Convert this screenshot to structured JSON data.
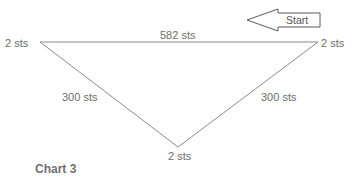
{
  "diagram": {
    "title": "Chart 3",
    "start_label": "Start",
    "vertices": {
      "left": {
        "label": "2 sts",
        "x": 40,
        "y": 42
      },
      "right": {
        "label": "2 sts",
        "x": 318,
        "y": 42
      },
      "bottom": {
        "label": "2 sts",
        "x": 178,
        "y": 147
      }
    },
    "edges": {
      "top": {
        "label": "582 sts",
        "from": "left",
        "to": "right"
      },
      "left": {
        "label": "300 sts",
        "from": "left",
        "to": "bottom"
      },
      "right": {
        "label": "300 sts",
        "from": "right",
        "to": "bottom"
      }
    },
    "colors": {
      "line": "#7a7a7a",
      "text": "#6e6e6e",
      "arrow_stroke": "#555555"
    }
  }
}
